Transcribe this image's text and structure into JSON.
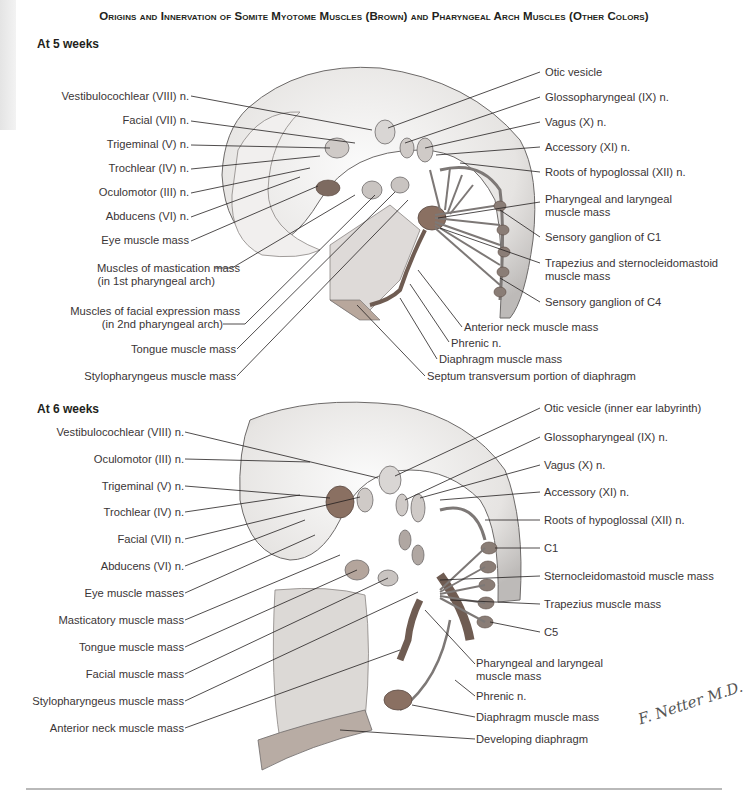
{
  "title": "Origins and Innervation of Somite Myotome Muscles (Brown) and Pharyngeal Arch Muscles (Other Colors)",
  "colors": {
    "somite_muscle": "#7a5a48",
    "embryo_body": "#e9e6e3",
    "nerve": "#8a8583",
    "text": "#231f20"
  },
  "panels": [
    {
      "heading": "At 5 weeks",
      "left_labels": [
        "Vestibulocochlear (VIII) n.",
        "Facial (VII) n.",
        "Trigeminal (V) n.",
        "Trochlear (IV) n.",
        "Oculomotor (III) n.",
        "Abducens (VI) n.",
        "Eye muscle mass",
        "Muscles of mastication mass",
        "(in 1st pharyngeal arch)",
        "Muscles of facial expression mass",
        "(in 2nd pharyngeal arch)",
        "Tongue muscle mass",
        "Stylopharyngeus muscle mass"
      ],
      "right_labels": [
        "Otic vesicle",
        "Glossopharyngeal (IX) n.",
        "Vagus (X) n.",
        "Accessory (XI) n.",
        "Roots of hypoglossal (XII) n.",
        "Pharyngeal and laryngeal",
        "muscle mass",
        "Sensory ganglion of C1",
        "Trapezius and sternocleidomastoid",
        "muscle mass",
        "Sensory ganglion of C4"
      ],
      "bottom_labels": [
        "Anterior neck muscle mass",
        "Phrenic n.",
        "Diaphragm muscle mass",
        "Septum transversum portion of diaphragm"
      ]
    },
    {
      "heading": "At 6 weeks",
      "left_labels": [
        "Vestibulocochlear (VIII) n.",
        "Oculomotor (III) n.",
        "Trigeminal (V) n.",
        "Trochlear (IV) n.",
        "Facial (VII) n.",
        "Abducens (VI) n.",
        "Eye muscle masses",
        "Masticatory muscle mass",
        "Tongue muscle mass",
        "Facial muscle mass",
        "Stylopharyngeus muscle mass",
        "Anterior neck muscle mass"
      ],
      "right_labels": [
        "Otic vesicle (inner ear labyrinth)",
        "Glossopharyngeal (IX) n.",
        "Vagus (X) n.",
        "Accessory (XI) n.",
        "Roots of hypoglossal (XII) n.",
        "C1",
        "Sternocleidomastoid muscle mass",
        "Trapezius muscle mass",
        "C5",
        "Pharyngeal and laryngeal",
        "muscle mass",
        "Phrenic n.",
        "Diaphragm muscle mass",
        "Developing diaphragm"
      ]
    }
  ],
  "signature": "F. Netter M.D."
}
